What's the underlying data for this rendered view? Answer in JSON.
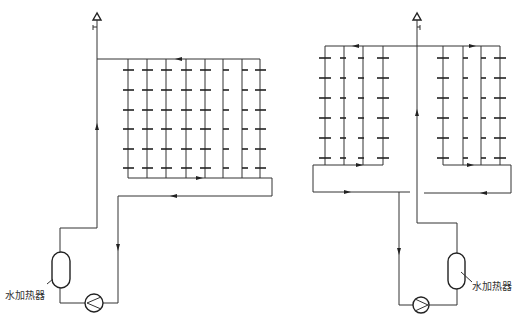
{
  "diagram": {
    "type": "hot-water-circulation-system",
    "colors": {
      "line": "#333333",
      "background": "#ffffff"
    },
    "left_system": {
      "heater_label": "水加热器",
      "main_riser_x": 97,
      "vent_top": [
        97,
        18
      ],
      "supply_header": {
        "y": 59,
        "x_from": 97,
        "x_to": 260
      },
      "risers_x": [
        128,
        147,
        166,
        186,
        205,
        223,
        242,
        260
      ],
      "branch_rows_y": [
        70,
        90,
        110,
        129,
        149,
        168
      ],
      "collector": {
        "y": 178,
        "x_from": 128,
        "x_to": 272
      },
      "return_line": {
        "y": 196,
        "x_from": 118,
        "x_to": 272
      },
      "return_down_x": 118,
      "heater": {
        "x": 52,
        "y": 252,
        "w": 18,
        "h": 36
      },
      "pump": {
        "cx": 94,
        "cy": 303,
        "r": 9
      }
    },
    "right_system": {
      "heater_label": "水加热器",
      "main_riser_x": 417,
      "vent_top": [
        417,
        18
      ],
      "supply_header": {
        "y": 46,
        "x_from": 325,
        "x_to": 500
      },
      "left_risers_x": [
        325,
        344,
        363,
        383
      ],
      "right_risers_x": [
        443,
        463,
        481,
        500
      ],
      "branch_rows_y": [
        58,
        78,
        98,
        118,
        138,
        158
      ],
      "left_collector": {
        "y": 165,
        "x_from": 313,
        "x_to": 383
      },
      "right_collector": {
        "y": 165,
        "x_from": 443,
        "x_to": 511
      },
      "left_return": {
        "y": 192,
        "x_from": 313,
        "x_to": 410
      },
      "right_return": {
        "y": 193,
        "x_from": 424,
        "x_to": 511
      },
      "return_down_x": 399,
      "heater": {
        "x": 448,
        "y": 253,
        "w": 17,
        "h": 36
      },
      "pump": {
        "cx": 421,
        "cy": 305,
        "r": 8
      }
    }
  }
}
